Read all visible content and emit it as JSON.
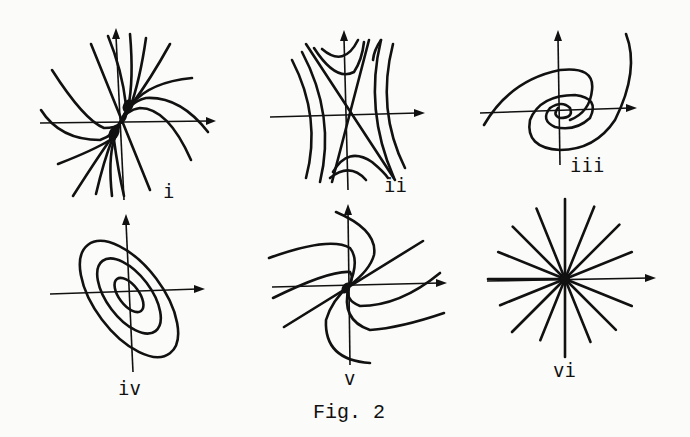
{
  "figure": {
    "caption": "Fig. 2",
    "panels": [
      {
        "id": "i",
        "label": "i",
        "type": "improper node (tangent node)"
      },
      {
        "id": "ii",
        "label": "ii",
        "type": "saddle point"
      },
      {
        "id": "iii",
        "label": "iii",
        "type": "spiral (focus)"
      },
      {
        "id": "iv",
        "label": "iv",
        "type": "center (ellipses)"
      },
      {
        "id": "v",
        "label": "v",
        "type": "degenerate node"
      },
      {
        "id": "vi",
        "label": "vi",
        "type": "star node (proper node)"
      }
    ]
  }
}
